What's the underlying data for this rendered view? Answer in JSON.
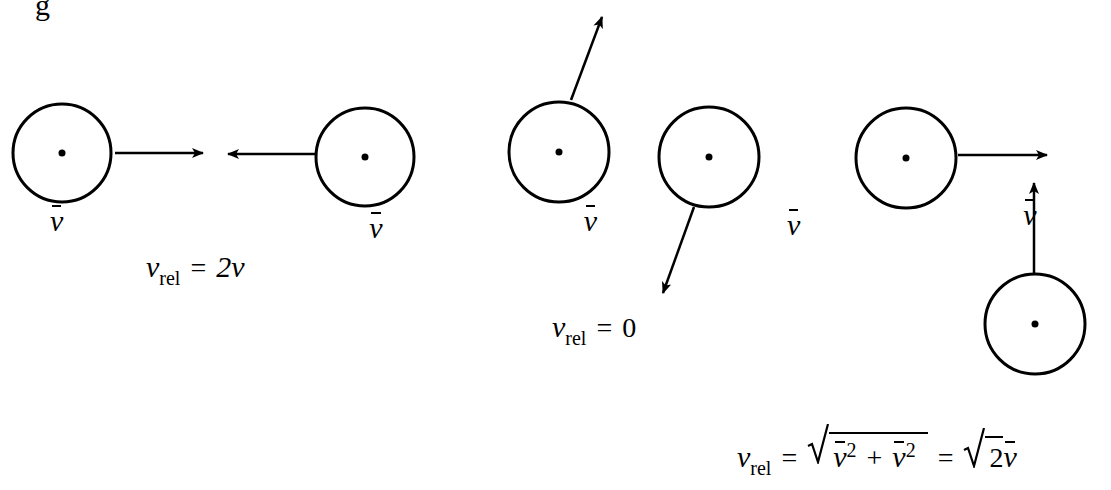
{
  "figure": {
    "top_fragment": "g",
    "velocity_symbol": "v",
    "panels": [
      {
        "name": "head-on",
        "particle_labels": [
          "v̄",
          "v̄"
        ],
        "equation": {
          "lhs": "v",
          "lhs_sub": "rel",
          "equals": "=",
          "rhs": "2v"
        }
      },
      {
        "name": "same-direction",
        "particle_labels": [
          "v̄",
          "v̄"
        ],
        "equation": {
          "lhs": "v",
          "lhs_sub": "rel",
          "equals": "=",
          "rhs": "0"
        }
      },
      {
        "name": "perpendicular",
        "particle_labels": [
          "v̄",
          "v̄"
        ],
        "equation": {
          "lhs": "v",
          "lhs_sub": "rel",
          "equals": "=",
          "term": "v̄",
          "power": "2",
          "plus": "+",
          "equals2": "=",
          "coef": "2",
          "result_var": "v̄"
        }
      }
    ],
    "colors": {
      "ink": "#000000",
      "background": "#ffffff"
    }
  }
}
